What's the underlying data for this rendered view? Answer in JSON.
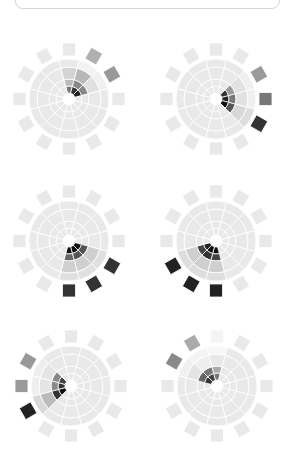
{
  "figure": {
    "spokes": 12,
    "base_color": "#e9e9e9",
    "separator_color": "#ffffff",
    "bands": [
      {
        "name": "ring1",
        "r0": 6,
        "r1": 13
      },
      {
        "name": "ring2",
        "r0": 13,
        "r1": 20
      },
      {
        "name": "ring3",
        "r0": 20,
        "r1": 32
      },
      {
        "name": "ring4",
        "r0": 32,
        "r1": 40
      },
      {
        "name": "petal",
        "r0": 43,
        "r1": 56
      }
    ],
    "wheels": [
      {
        "id": "wheel-1",
        "cx": 69,
        "cy": 99,
        "highlights": [
          {
            "spoke": 0,
            "ring1": "#777777",
            "ring2": "#bbbbbb",
            "ring3": "#d4d4d4"
          },
          {
            "spoke": 1,
            "ring1": "#333333",
            "ring2": "#888888",
            "ring3": "#b8b8b8",
            "ring4": "#f2f2f2",
            "petal": "#b0b0b0"
          },
          {
            "spoke": 2,
            "ring1": "#222222",
            "ring2": "#888888",
            "ring3": "#e0e0e0",
            "ring4": "#f0f0f0",
            "petal": "#999999"
          }
        ]
      },
      {
        "id": "wheel-2",
        "cx": 216,
        "cy": 99,
        "highlights": [
          {
            "spoke": 2,
            "ring1": "#333333",
            "ring2": "#999999",
            "ring3": "#e2e2e2",
            "ring4": "#efefef",
            "petal": "#9a9a9a"
          },
          {
            "spoke": 3,
            "ring1": "#222222",
            "ring2": "#777777",
            "ring3": "#e2e2e2",
            "ring4": "#efefef",
            "petal": "#777777"
          },
          {
            "spoke": 4,
            "ring1": "#111111",
            "ring2": "#555555",
            "ring3": "#d8d8d8",
            "ring4": "#dddddd",
            "petal": "#333333"
          }
        ]
      },
      {
        "id": "wheel-3",
        "cx": 69,
        "cy": 241,
        "highlights": [
          {
            "spoke": 4,
            "ring1": "#111111",
            "ring2": "#555555",
            "ring3": "#cfcfcf",
            "ring4": "#e0e0e0",
            "petal": "#333333"
          },
          {
            "spoke": 5,
            "ring1": "#111111",
            "ring2": "#555555",
            "ring3": "#cfcfcf",
            "ring4": "#e0e0e0",
            "petal": "#333333"
          },
          {
            "spoke": 6,
            "ring1": "#111111",
            "ring2": "#666666",
            "ring3": "#cfcfcf",
            "ring4": "#e0e0e0",
            "petal": "#333333"
          }
        ]
      },
      {
        "id": "wheel-4",
        "cx": 216,
        "cy": 241,
        "highlights": [
          {
            "spoke": 6,
            "ring1": "#111111",
            "ring2": "#444444",
            "ring3": "#cfcfcf",
            "ring4": "#dddddd",
            "petal": "#222222"
          },
          {
            "spoke": 7,
            "ring1": "#111111",
            "ring2": "#333333",
            "ring3": "#cfcfcf",
            "ring4": "#dddddd",
            "petal": "#222222"
          },
          {
            "spoke": 8,
            "ring1": "#222222",
            "ring2": "#444444",
            "ring3": "#cfcfcf",
            "ring4": "#dddddd",
            "petal": "#222222"
          }
        ]
      },
      {
        "id": "wheel-5",
        "cx": 71,
        "cy": 386,
        "highlights": [
          {
            "spoke": 8,
            "ring1": "#111111",
            "ring2": "#333333",
            "ring3": "#bbbbbb",
            "ring4": "#d8d8d8",
            "petal": "#222222"
          },
          {
            "spoke": 9,
            "ring1": "#333333",
            "ring2": "#888888",
            "ring3": "#e4e4e4",
            "ring4": "#eeeeee",
            "petal": "#999999"
          },
          {
            "spoke": 10,
            "ring1": "#444444",
            "ring2": "#888888",
            "ring3": "#e4e4e4",
            "ring4": "#eeeeee",
            "petal": "#999999"
          }
        ]
      },
      {
        "id": "wheel-6",
        "cx": 217,
        "cy": 386,
        "highlights": [
          {
            "spoke": 10,
            "ring1": "#333333",
            "ring2": "#666666",
            "ring3": "#e4e4e4",
            "ring4": "#f0f0f0",
            "petal": "#8a8a8a"
          },
          {
            "spoke": 11,
            "ring1": "#444444",
            "ring2": "#777777",
            "ring3": "#eeeeee",
            "ring4": "#f4f4f4",
            "petal": "#aaaaaa"
          },
          {
            "spoke": 0,
            "ring1": "#777777",
            "ring2": "#aaaaaa",
            "ring3": "#e8e8e8",
            "ring4": "#f6f6f6",
            "petal": "#f4f4f4"
          }
        ]
      }
    ]
  }
}
